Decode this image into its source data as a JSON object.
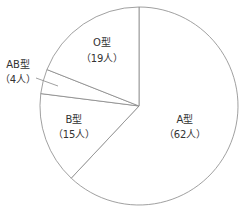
{
  "chart_data": {
    "type": "pie",
    "title": "",
    "start_angle_deg": 0,
    "direction": "clockwise",
    "total": 100,
    "unit": "人",
    "slices": [
      {
        "name": "A型",
        "value": 62,
        "label": "A型",
        "sublabel": "（62人）"
      },
      {
        "name": "B型",
        "value": 15,
        "label": "B型",
        "sublabel": "（15人）"
      },
      {
        "name": "AB型",
        "value": 4,
        "label": "AB型",
        "sublabel": "（4人）"
      },
      {
        "name": "O型",
        "value": 19,
        "label": "O型",
        "sublabel": "（19人）"
      }
    ],
    "colors": {
      "fill": "#ffffff",
      "stroke": "#888888",
      "text": "#333333"
    },
    "legend": "none (labels inside slices; AB型 label outside with leader line)"
  }
}
